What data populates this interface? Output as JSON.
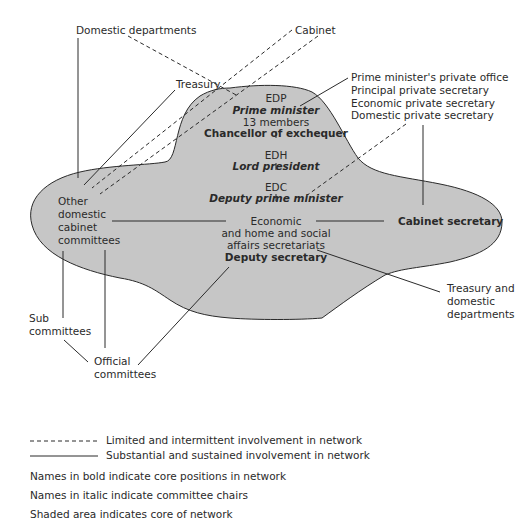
{
  "diagram": {
    "core": {
      "edp": "EDP",
      "prime_minister": "Prime minister",
      "members": "13 members",
      "chancellor": "Chancellor of exchequer",
      "edh": "EDH",
      "lord_president": "Lord president",
      "edc": "EDC",
      "deputy_pm": "Deputy prime minister",
      "secretariats": [
        "Economic",
        "and home and social",
        "affairs secretariats"
      ],
      "deputy_secretary": "Deputy secretary",
      "cabinet_secretary": "Cabinet secretary",
      "other_committees": [
        "Other",
        "domestic",
        "cabinet",
        "committees"
      ]
    },
    "outer": {
      "domestic_departments": "Domestic departments",
      "cabinet": "Cabinet",
      "treasury": "Treasury",
      "pm_office": [
        "Prime minister's private office",
        "Principal private secretary",
        "Economic private secretary",
        "Domestic private secretary"
      ],
      "treasury_domestic": [
        "Treasury and",
        "domestic",
        "departments"
      ],
      "sub_committees": [
        "Sub",
        "committees"
      ],
      "official_committees": [
        "Official",
        "committees"
      ]
    },
    "colors": {
      "shaded": "#c6c6c6",
      "line": "#2a2a2a"
    }
  },
  "legend": {
    "dashed": "Limited and intermittent involvement in network",
    "solid": "Substantial and sustained involvement in network",
    "bold_note": "Names in bold indicate core positions in network",
    "italic_note": "Names in italic indicate committee chairs",
    "shaded_note": "Shaded area indicates core of network"
  }
}
